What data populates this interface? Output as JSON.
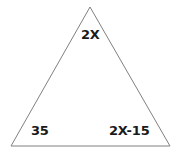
{
  "figure": {
    "kind": "triangle-angle-diagram",
    "background_color": "#ffffff",
    "stroke_color": "#808080",
    "label_color": "#1a1a1a",
    "canvas": {
      "width": 178,
      "height": 153
    },
    "vertices": {
      "apex": {
        "x": 90,
        "y": 7
      },
      "bottom_left": {
        "x": 11,
        "y": 146
      },
      "bottom_right": {
        "x": 170,
        "y": 146
      }
    },
    "labels": {
      "apex": "2X",
      "bottom_left": "35",
      "bottom_right": "2X-15"
    }
  }
}
